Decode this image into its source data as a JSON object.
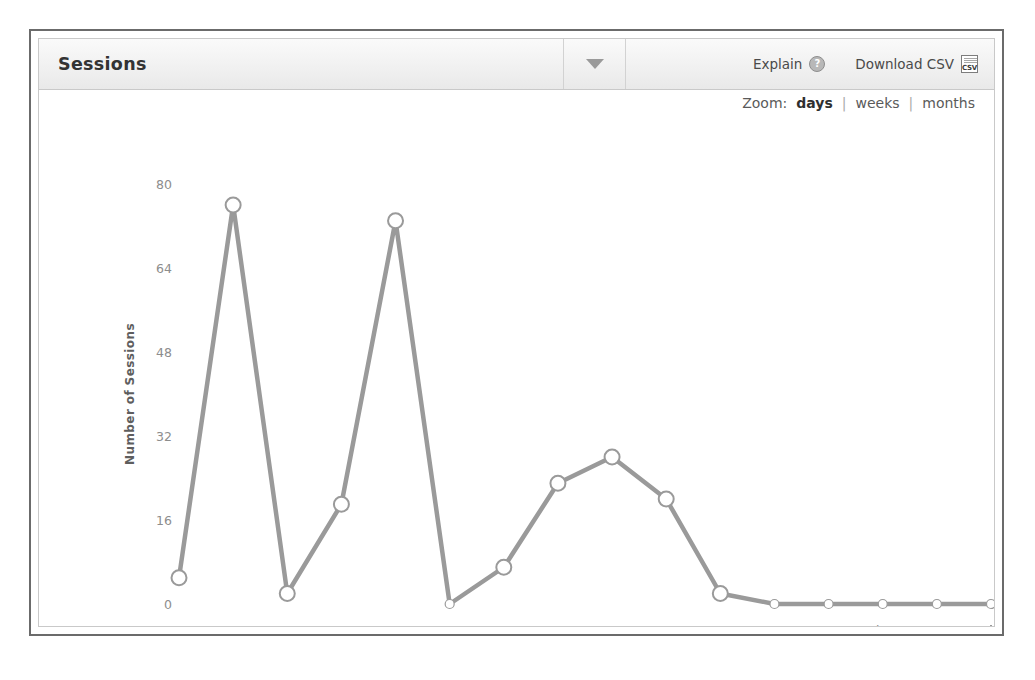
{
  "panel": {
    "title": "Sessions",
    "dropdown_icon": "chevron-down-icon",
    "explain_label": "Explain",
    "explain_icon": "help-globe-icon",
    "download_label": "Download CSV",
    "download_icon": "csv-file-icon",
    "csv_icon_text": "CSV"
  },
  "zoom": {
    "label": "Zoom:",
    "separator": "|",
    "options": [
      {
        "label": "days",
        "active": true
      },
      {
        "label": "weeks",
        "active": false
      },
      {
        "label": "months",
        "active": false
      }
    ]
  },
  "chart_data": {
    "type": "line",
    "title": "",
    "xlabel": "",
    "ylabel": "Number of Sessions",
    "ylim": [
      0,
      80
    ],
    "yticks": [
      0,
      16,
      32,
      48,
      64,
      80
    ],
    "ytick_labels": [
      "0",
      "16",
      "32",
      "48",
      "64",
      "80"
    ],
    "grid": false,
    "legend": "none",
    "marker": "open-circle",
    "line_color": "#9a9a9a",
    "marker_fill": "#ffffff",
    "marker_stroke": "#9a9a9a",
    "x": [
      "Jan 19",
      "Jan 20",
      "Jan 21",
      "Jan 22",
      "Jan 23",
      "Jan 24",
      "Jan 25",
      "Jan 26",
      "Jan 27",
      "Jan 28",
      "Jan 29",
      "Jan 30",
      "Jan 31",
      "Feb 01",
      "Feb 02",
      "Feb 03"
    ],
    "xtick_labels": [
      "Jan 20",
      "Jan 22",
      "Jan 24",
      "Jan 26",
      "Jan 28",
      "Jan 30",
      "Feb 01"
    ],
    "xtick_indices": [
      1,
      3,
      5,
      7,
      9,
      11,
      13
    ],
    "values": [
      5,
      76,
      2,
      19,
      73,
      0,
      7,
      23,
      28,
      20,
      2,
      0,
      0,
      0,
      0,
      0
    ],
    "series": [
      {
        "name": "Sessions",
        "values": [
          5,
          76,
          2,
          19,
          73,
          0,
          7,
          23,
          28,
          20,
          2,
          0,
          0,
          0,
          0,
          0
        ]
      }
    ]
  }
}
